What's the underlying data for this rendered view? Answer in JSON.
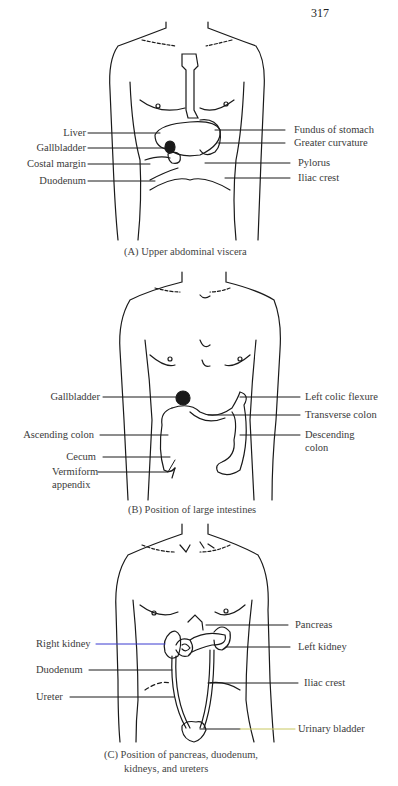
{
  "page_number": "317",
  "panels": [
    {
      "id": "A",
      "caption": "(A) Upper abdominal viscera",
      "left_labels": [
        "Liver",
        "Gallbladder",
        "Costal margin",
        "Duodenum"
      ],
      "right_labels": [
        "Fundus of stomach",
        "Greater curvature",
        "Pylorus",
        "Iliac crest"
      ]
    },
    {
      "id": "B",
      "caption": "(B) Position of large intestines",
      "left_labels": [
        "Gallbladder",
        "Ascending colon",
        "Cecum",
        "Vermiform",
        "appendix"
      ],
      "right_labels": [
        "Left colic flexure",
        "Transverse colon",
        "Descending",
        "colon"
      ]
    },
    {
      "id": "C",
      "caption_line1": "(C) Position of pancreas, duodenum,",
      "caption_line2": "kidneys, and ureters",
      "left_labels": [
        "Right kidney",
        "Duodenum",
        "Ureter"
      ],
      "right_labels": [
        "Pancreas",
        "Left kidney",
        "Iliac crest",
        "Urinary bladder"
      ]
    }
  ],
  "colors": {
    "line": "#1a1a1a",
    "right_kidney_leader": "#3b3bd0",
    "urinary_bladder_leader": "#c8c860"
  }
}
